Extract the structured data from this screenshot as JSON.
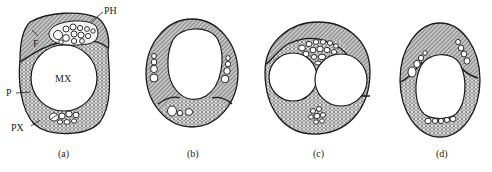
{
  "figure": {
    "colors": {
      "outline": "#1a1a1a",
      "hatch_bg": "#bdbdbd",
      "hatch_line": "#333333",
      "mesh_bg": "#e6e6e6",
      "mesh_line": "#2a2a2a",
      "background": "#ffffff"
    },
    "legend_labels": {
      "F": "F",
      "PH": "PH",
      "MX": "MX",
      "P": "P",
      "PX": "PX"
    },
    "panels": [
      {
        "id": "a",
        "caption": "(a)"
      },
      {
        "id": "b",
        "caption": "(b)"
      },
      {
        "id": "c",
        "caption": "(c)"
      },
      {
        "id": "d",
        "caption": "(d)"
      }
    ]
  }
}
